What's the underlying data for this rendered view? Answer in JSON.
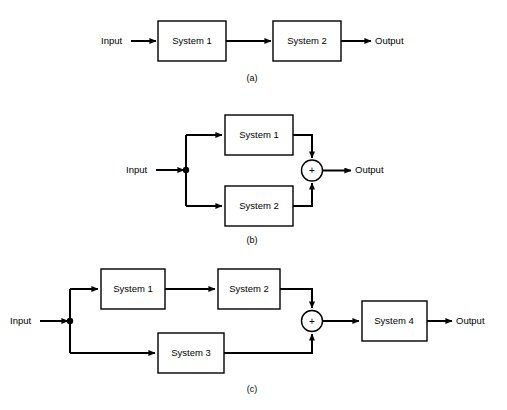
{
  "figure": {
    "background_color": "#ffffff",
    "line_color": "#000000",
    "panels": [
      {
        "caption": "(a)",
        "kind": "cascade-series",
        "input_label": "Input",
        "output_label": "Output",
        "blocks": [
          {
            "label": "System 1"
          },
          {
            "label": "System 2"
          }
        ],
        "summers": []
      },
      {
        "caption": "(b)",
        "kind": "parallel",
        "input_label": "Input",
        "output_label": "Output",
        "blocks": [
          {
            "label": "System 1"
          },
          {
            "label": "System 2"
          }
        ],
        "summers": [
          {
            "sign": "+"
          }
        ]
      },
      {
        "caption": "(c)",
        "kind": "parallel-then-cascade",
        "input_label": "Input",
        "output_label": "Output",
        "blocks": [
          {
            "label": "System 1"
          },
          {
            "label": "System 2"
          },
          {
            "label": "System 3"
          },
          {
            "label": "System 4"
          }
        ],
        "summers": [
          {
            "sign": "+"
          }
        ]
      }
    ]
  }
}
